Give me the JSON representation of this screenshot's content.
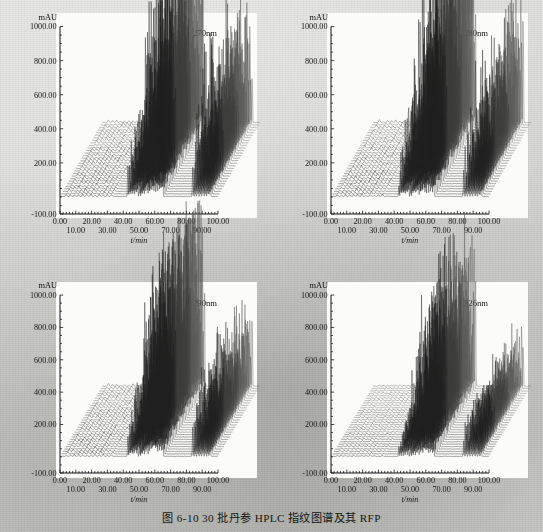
{
  "figure": {
    "caption": "图 6-10  30 批丹参 HPLC 指纹图谱及其 RFP",
    "background_color": "#c9c9c6",
    "plot_background_color": "#fbfbfa",
    "trace_color": "#20201f",
    "n_batches": 30
  },
  "axes_common": {
    "y_unit": "mAU",
    "y_ticks": [
      "1000.00",
      "800.00",
      "600.00",
      "400.00",
      "200.00",
      "-100.00"
    ],
    "y_tick_values": [
      1000,
      800,
      600,
      400,
      200,
      -100
    ],
    "ylim": [
      -100,
      1050
    ],
    "x_label": "t/min",
    "x_ticks_upper": [
      "0.00",
      "20.00",
      "40.00",
      "60.00",
      "80.00",
      "100.00"
    ],
    "x_ticks_lower": [
      "10.00",
      "30.00",
      "50.00",
      "70.00",
      "90.00"
    ],
    "x_tick_values_upper": [
      0,
      20,
      40,
      60,
      80,
      100
    ],
    "x_tick_values_lower": [
      10,
      30,
      50,
      70,
      90
    ],
    "xlim": [
      0,
      100
    ],
    "grid": false
  },
  "panels": [
    {
      "id": "panel-270",
      "wavelength_label": "270nm",
      "position": "top-left"
    },
    {
      "id": "panel-280",
      "wavelength_label": "280nm",
      "position": "top-right"
    },
    {
      "id": "panel-290",
      "wavelength_label": "290nm",
      "position": "bottom-left"
    },
    {
      "id": "panel-326",
      "wavelength_label": "326nm",
      "position": "bottom-right"
    }
  ],
  "chart_data": [
    {
      "type": "line",
      "id": "panel-270",
      "title": "270nm",
      "xlabel": "t/min",
      "ylabel": "mAU",
      "xlim": [
        0,
        100
      ],
      "ylim": [
        -100,
        1050
      ],
      "grid": false,
      "projection": "3d-waterfall",
      "n_series": 30,
      "series_note": "30 batches of Salvia miltiorrhiza HPLC fingerprints, stacked with constant x/y offset",
      "peak_clusters": [
        {
          "t_min": 42,
          "t_max": 50,
          "max_mAU": 620,
          "label": "cluster-1"
        },
        {
          "t_min": 50,
          "t_max": 58,
          "max_mAU": 930,
          "label": "cluster-2"
        },
        {
          "t_min": 58,
          "t_max": 66,
          "max_mAU": 1050,
          "label": "cluster-3"
        },
        {
          "t_min": 82,
          "t_max": 96,
          "max_mAU": 960,
          "label": "cluster-4"
        }
      ]
    },
    {
      "type": "line",
      "id": "panel-280",
      "title": "280nm",
      "xlabel": "t/min",
      "ylabel": "mAU",
      "xlim": [
        0,
        100
      ],
      "ylim": [
        -100,
        1050
      ],
      "grid": false,
      "projection": "3d-waterfall",
      "n_series": 30,
      "peak_clusters": [
        {
          "t_min": 42,
          "t_max": 50,
          "max_mAU": 700,
          "label": "cluster-1"
        },
        {
          "t_min": 50,
          "t_max": 58,
          "max_mAU": 1000,
          "label": "cluster-2"
        },
        {
          "t_min": 58,
          "t_max": 66,
          "max_mAU": 1050,
          "label": "cluster-3"
        },
        {
          "t_min": 84,
          "t_max": 96,
          "max_mAU": 820,
          "label": "cluster-4"
        }
      ]
    },
    {
      "type": "line",
      "id": "panel-290",
      "title": "290nm",
      "xlabel": "t/min",
      "ylabel": "mAU",
      "xlim": [
        0,
        100
      ],
      "ylim": [
        -100,
        1050
      ],
      "grid": false,
      "projection": "3d-waterfall",
      "n_series": 30,
      "peak_clusters": [
        {
          "t_min": 42,
          "t_max": 50,
          "max_mAU": 640,
          "label": "cluster-1"
        },
        {
          "t_min": 50,
          "t_max": 58,
          "max_mAU": 980,
          "label": "cluster-2"
        },
        {
          "t_min": 58,
          "t_max": 66,
          "max_mAU": 1050,
          "label": "cluster-3"
        },
        {
          "t_min": 84,
          "t_max": 96,
          "max_mAU": 660,
          "label": "cluster-4"
        }
      ]
    },
    {
      "type": "line",
      "id": "panel-326",
      "title": "326nm",
      "xlabel": "t/min",
      "ylabel": "mAU",
      "xlim": [
        0,
        100
      ],
      "ylim": [
        -100,
        1050
      ],
      "grid": false,
      "projection": "3d-waterfall",
      "n_series": 30,
      "peak_clusters": [
        {
          "t_min": 40,
          "t_max": 50,
          "max_mAU": 540,
          "label": "cluster-1"
        },
        {
          "t_min": 50,
          "t_max": 58,
          "max_mAU": 900,
          "label": "cluster-2"
        },
        {
          "t_min": 58,
          "t_max": 66,
          "max_mAU": 1050,
          "label": "cluster-3"
        },
        {
          "t_min": 86,
          "t_max": 95,
          "max_mAU": 640,
          "label": "cluster-4"
        }
      ]
    }
  ]
}
